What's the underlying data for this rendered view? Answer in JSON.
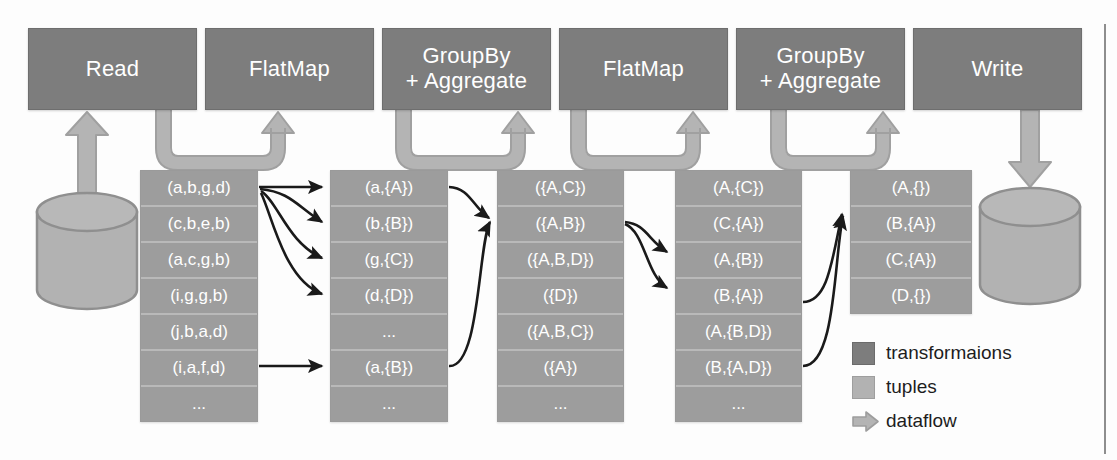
{
  "diagram": {
    "colors": {
      "transformation_box": "#7d7d7d",
      "tuple_cell": "#9d9d9d",
      "tuple_frame": "#b0b0b0",
      "dataflow_arrow": "#b4b4b4",
      "tuple_arrow": "#1a1a1a",
      "background": "#ffffff"
    },
    "operators": [
      {
        "id": "read",
        "label": "Read"
      },
      {
        "id": "flatmap-1",
        "label": "FlatMap"
      },
      {
        "id": "groupby-1",
        "label": "GroupBy\n+ Aggregate"
      },
      {
        "id": "flatmap-2",
        "label": "FlatMap"
      },
      {
        "id": "groupby-2",
        "label": "GroupBy\n+ Aggregate"
      },
      {
        "id": "write",
        "label": "Write"
      }
    ],
    "sources": [
      {
        "id": "input-store",
        "name": "input-datastore"
      },
      {
        "id": "output-store",
        "name": "output-datastore"
      }
    ],
    "tuple_columns": [
      {
        "id": "col-input",
        "after": "read",
        "rows": [
          "(a,b,g,d)",
          "(c,b,e,b)",
          "(a,c,g,b)",
          "(i,g,g,b)",
          "(j,b,a,d)",
          "(i,a,f,d)",
          "..."
        ]
      },
      {
        "id": "col-flatmap-1",
        "after": "flatmap-1",
        "rows": [
          "(a,{A})",
          "(b,{B})",
          "(g,{C})",
          "(d,{D})",
          "...",
          "(a,{B})",
          "..."
        ]
      },
      {
        "id": "col-groupby-1",
        "after": "groupby-1",
        "rows": [
          "({A,C})",
          "({A,B})",
          "({A,B,D})",
          "({D})",
          "({A,B,C})",
          "({A})",
          "..."
        ]
      },
      {
        "id": "col-flatmap-2",
        "after": "flatmap-2",
        "rows": [
          "(A,{C})",
          "(C,{A})",
          "(A,{B})",
          "(B,{A})",
          "(A,{B,D})",
          "(B,{A,D})",
          "..."
        ]
      },
      {
        "id": "col-groupby-2",
        "after": "groupby-2",
        "rows": [
          "(A,{})",
          "(B,{A})",
          "(C,{A})",
          "(D,{})"
        ]
      }
    ],
    "legend": {
      "items": [
        {
          "id": "legend-transformations",
          "glyph": "filled-square-dark",
          "label": "transformaions"
        },
        {
          "id": "legend-tuples",
          "glyph": "filled-square-light",
          "label": "tuples"
        },
        {
          "id": "legend-dataflow",
          "glyph": "right-arrow",
          "label": "dataflow"
        }
      ]
    }
  }
}
